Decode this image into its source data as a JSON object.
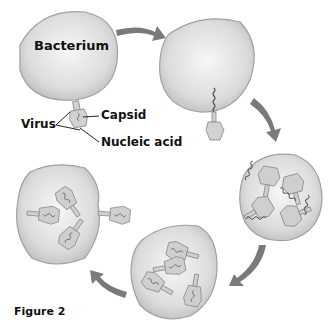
{
  "figure": {
    "caption": "Figure 2",
    "type": "virus lytic cycle"
  },
  "labels": {
    "bacterium": "Bacterium",
    "virus": "Virus",
    "capsid": "Capsid",
    "nucleic_acid": "Nucleic acid"
  },
  "stages": [
    {
      "id": 1,
      "description": "Virus attaches to bacterium"
    },
    {
      "id": 2,
      "description": "Virus injects nucleic acid into bacterium"
    },
    {
      "id": 3,
      "description": "Viral parts are produced inside bacterium"
    },
    {
      "id": 4,
      "description": "New viruses assemble"
    },
    {
      "id": 5,
      "description": "Bacterium bursts releasing new viruses"
    }
  ],
  "colors": {
    "cell_fill": "#d9d9d9",
    "cell_edge": "#9a9a9a",
    "arrow": "#7a7a7a",
    "virus_fill": "#c9c9c9"
  }
}
